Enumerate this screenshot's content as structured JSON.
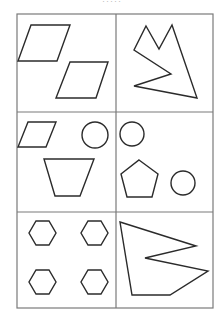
{
  "header": {
    "caption": "·····"
  },
  "grid": {
    "rows": 3,
    "cols": 2,
    "line_color": "#7a7a7a",
    "shape_color": "#2b2b2b"
  },
  "cells": [
    {
      "id": "r1c1",
      "description": "two parallelograms"
    },
    {
      "id": "r1c2",
      "description": "concave polygon with two peaks"
    },
    {
      "id": "r2c1",
      "description": "parallelogram, circle, trapezoid"
    },
    {
      "id": "r2c2",
      "description": "two circles and a pentagon"
    },
    {
      "id": "r3c1",
      "description": "four hexagons"
    },
    {
      "id": "r3c2",
      "description": "concave polygon with notch"
    }
  ]
}
